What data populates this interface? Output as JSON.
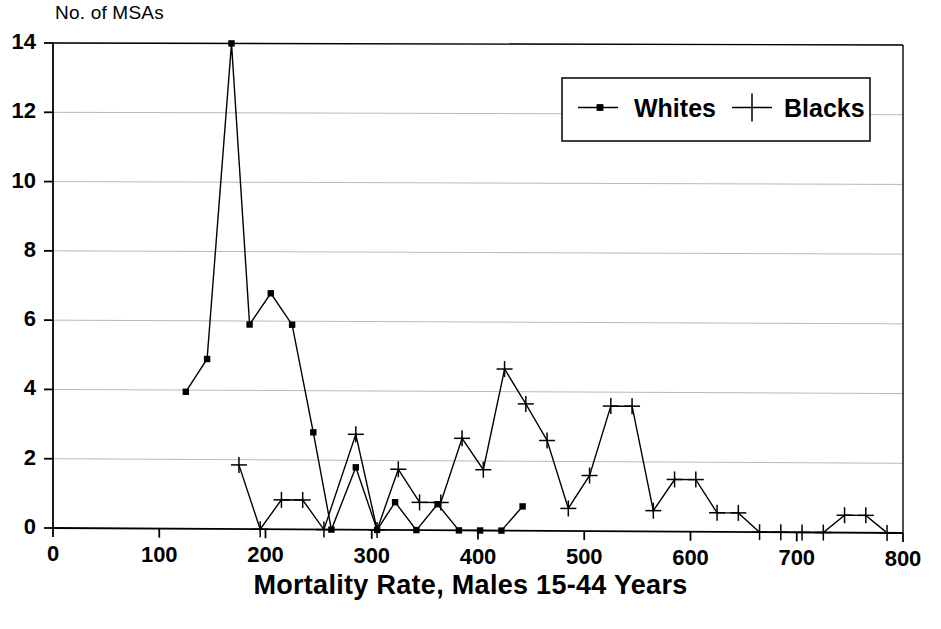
{
  "chart_data": {
    "type": "line",
    "title": "",
    "ylabel": "No. of MSAs",
    "xlabel": "Mortality Rate, Males 15-44 Years",
    "xlim": [
      0,
      800
    ],
    "ylim": [
      0,
      14
    ],
    "xticks": [
      0,
      100,
      200,
      300,
      400,
      500,
      600,
      700,
      800
    ],
    "yticks": [
      0,
      2,
      4,
      6,
      8,
      10,
      12,
      14
    ],
    "grid": true,
    "legend_position": "top-right",
    "series": [
      {
        "name": "Whites",
        "marker": "square",
        "points": [
          [
            125,
            3.95
          ],
          [
            145,
            4.9
          ],
          [
            168,
            14.0
          ],
          [
            185,
            5.9
          ],
          [
            205,
            6.8
          ],
          [
            225,
            5.9
          ],
          [
            245,
            2.8
          ],
          [
            262,
            0.0
          ],
          [
            285,
            1.8
          ],
          [
            305,
            0.0
          ],
          [
            322,
            0.8
          ],
          [
            342,
            0.0
          ],
          [
            362,
            0.75
          ],
          [
            382,
            0.0
          ],
          [
            402,
            0.0
          ],
          [
            422,
            0.0
          ],
          [
            442,
            0.7
          ]
        ]
      },
      {
        "name": "Blacks",
        "marker": "plus",
        "points": [
          [
            175,
            1.85
          ],
          [
            195,
            0.0
          ],
          [
            215,
            0.85
          ],
          [
            235,
            0.85
          ],
          [
            255,
            0.0
          ],
          [
            285,
            2.75
          ],
          [
            305,
            0.0
          ],
          [
            325,
            1.75
          ],
          [
            345,
            0.8
          ],
          [
            365,
            0.8
          ],
          [
            385,
            2.65
          ],
          [
            405,
            1.75
          ],
          [
            425,
            4.65
          ],
          [
            445,
            3.65
          ],
          [
            465,
            2.6
          ],
          [
            485,
            0.65
          ],
          [
            505,
            1.6
          ],
          [
            525,
            3.6
          ],
          [
            545,
            3.6
          ],
          [
            565,
            0.6
          ],
          [
            585,
            1.5
          ],
          [
            605,
            1.5
          ],
          [
            625,
            0.55
          ],
          [
            645,
            0.55
          ],
          [
            665,
            0.0
          ],
          [
            685,
            0.0
          ],
          [
            705,
            0.0
          ],
          [
            725,
            0.0
          ],
          [
            745,
            0.5
          ],
          [
            765,
            0.5
          ],
          [
            785,
            0.0
          ]
        ]
      }
    ],
    "legend": [
      {
        "label": "Whites",
        "marker": "square"
      },
      {
        "label": "Blacks",
        "marker": "plus"
      }
    ]
  },
  "axes": {
    "x_tick_labels": [
      "0",
      "100",
      "200",
      "300",
      "400",
      "500",
      "600",
      "700",
      "800"
    ],
    "y_tick_labels": [
      "0",
      "2",
      "4",
      "6",
      "8",
      "10",
      "12",
      "14"
    ]
  },
  "colors": {
    "ink": "#000000",
    "grid": "#b8b8b8",
    "background": "#ffffff"
  }
}
